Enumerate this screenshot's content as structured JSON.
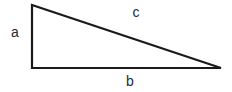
{
  "diagram": {
    "type": "right-triangle",
    "vertices": {
      "top_left": [
        32,
        5
      ],
      "bottom_left": [
        32,
        68
      ],
      "bottom_right": [
        221,
        68
      ]
    },
    "stroke_color": "#1a1a1a",
    "labels": {
      "a": "a",
      "b": "b",
      "c": "c"
    }
  }
}
